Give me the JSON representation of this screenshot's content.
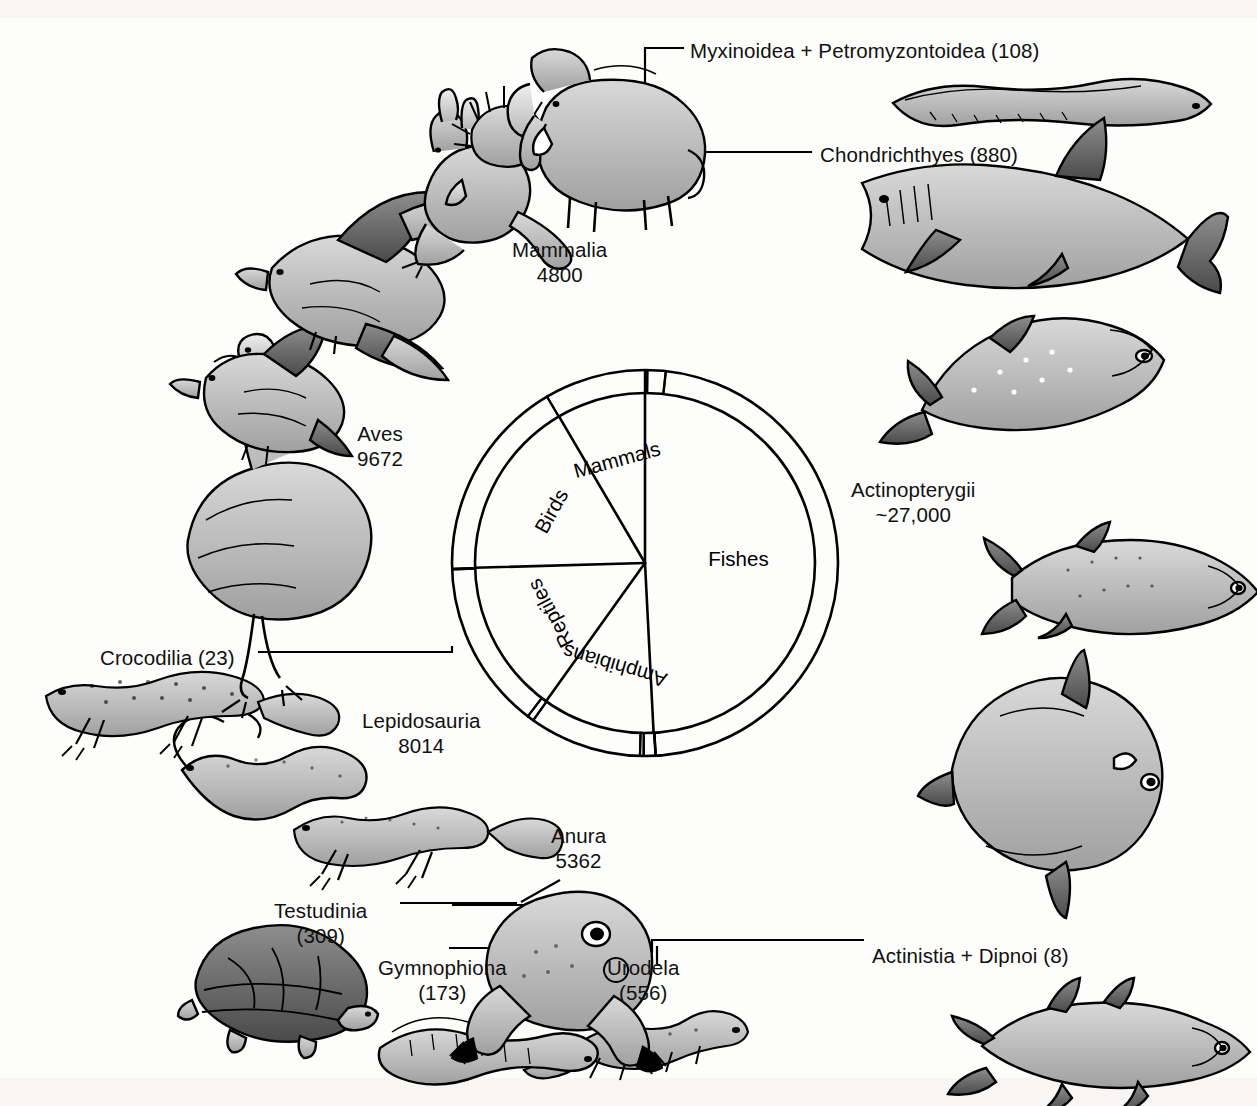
{
  "figure": {
    "type": "sunburst",
    "title": "",
    "background": "#fdfdfb",
    "stroke": "#000000",
    "center": {
      "x": 645,
      "y": 563
    },
    "inner_radius": 170,
    "outer_radius": 193
  },
  "inner_ring": {
    "label": "Vertebrate classes",
    "segments": [
      {
        "name": "Fishes",
        "label": "Fishes",
        "value": 27996,
        "start_deg": -90,
        "end_deg": 87.1,
        "rotate": 0
      },
      {
        "name": "Amphibians",
        "label": "Amphibians",
        "value": 6091,
        "start_deg": 87.1,
        "end_deg": 125.6,
        "rotate": 73
      },
      {
        "name": "Reptiles",
        "label": "Reptiles",
        "value": 8346,
        "start_deg": 125.6,
        "end_deg": 178.4,
        "rotate": 28
      },
      {
        "name": "Birds",
        "label": "Birds",
        "value": 9672,
        "start_deg": 178.4,
        "end_deg": 239.6,
        "rotate": -27
      },
      {
        "name": "Mammals",
        "label": "Mammals",
        "value": 4800,
        "start_deg": 239.6,
        "end_deg": 270,
        "rotate": -75
      }
    ]
  },
  "outer_ring": {
    "label": "Taxa with species counts",
    "segments": [
      {
        "name": "myxinoidea-petromyzontoidea",
        "taxon": "Myxinoidea + Petromyzontoidea",
        "count": "108",
        "count_display": "(108)",
        "start_deg": -90.0,
        "end_deg": -89.3
      },
      {
        "name": "chondrichthyes",
        "taxon": "Chondrichthyes",
        "count": "880",
        "count_display": "(880)",
        "start_deg": -89.3,
        "end_deg": -83.8
      },
      {
        "name": "actinopterygii",
        "taxon": "Actinopterygii",
        "count": "~27,000",
        "count_display": "~27,000",
        "start_deg": -83.8,
        "end_deg": 86.8
      },
      {
        "name": "actinistia-dipnoi",
        "taxon": "Actinistia + Dipnoi",
        "count": "8",
        "count_display": "(8)",
        "start_deg": 86.8,
        "end_deg": 86.9
      },
      {
        "name": "urodela",
        "taxon": "Urodela",
        "count": "556",
        "count_display": "(556)",
        "start_deg": 86.9,
        "end_deg": 90.4
      },
      {
        "name": "gymnophiona",
        "taxon": "Gymnophiona",
        "count": "173",
        "count_display": "(173)",
        "start_deg": 90.4,
        "end_deg": 91.5
      },
      {
        "name": "anura",
        "taxon": "Anura",
        "count": "5362",
        "count_display": "5362",
        "start_deg": 91.5,
        "end_deg": 125.4
      },
      {
        "name": "testudinia",
        "taxon": "Testudinia",
        "count": "309",
        "count_display": "(309)",
        "start_deg": 125.4,
        "end_deg": 127.4
      },
      {
        "name": "lepidosauria",
        "taxon": "Lepidosauria",
        "count": "8014",
        "count_display": "8014",
        "start_deg": 127.4,
        "end_deg": 178.1
      },
      {
        "name": "crocodilia",
        "taxon": "Crocodilia",
        "count": "23",
        "count_display": "(23)",
        "start_deg": 178.1,
        "end_deg": 178.3
      },
      {
        "name": "aves",
        "taxon": "Aves",
        "count": "9672",
        "count_display": "9672",
        "start_deg": 178.3,
        "end_deg": 239.5
      },
      {
        "name": "mammalia",
        "taxon": "Mammalia",
        "count": "4800",
        "count_display": "4800",
        "start_deg": 239.5,
        "end_deg": 270.0
      }
    ]
  },
  "callout_labels": [
    {
      "name": "label-myxinoidea",
      "line1": "Myxinoidea + Petromyzontoidea (108)",
      "line2": "",
      "x": 690,
      "y": 38,
      "align": "left"
    },
    {
      "name": "label-chondrichthyes",
      "line1": "Chondrichthyes (880)",
      "line2": "",
      "x": 820,
      "y": 142,
      "align": "left"
    },
    {
      "name": "label-actinopterygii",
      "line1": "Actinopterygii",
      "line2": "~27,000",
      "x": 851,
      "y": 477,
      "align": "left"
    },
    {
      "name": "label-actinistia",
      "line1": "Actinistia + Dipnoi (8)",
      "line2": "",
      "x": 872,
      "y": 943,
      "align": "left"
    },
    {
      "name": "label-urodela",
      "line1": "Urodela",
      "line2": "(556)",
      "x": 607,
      "y": 955,
      "align": "left"
    },
    {
      "name": "label-gymnophiona",
      "line1": "Gymnophiona",
      "line2": "(173)",
      "x": 378,
      "y": 955,
      "align": "left"
    },
    {
      "name": "label-testudinia",
      "line1": "Testudinia",
      "line2": "(309)",
      "x": 274,
      "y": 898,
      "align": "left"
    },
    {
      "name": "label-crocodilia",
      "line1": "Crocodilia (23)",
      "line2": "",
      "x": 100,
      "y": 645,
      "align": "left"
    },
    {
      "name": "label-anura",
      "line1": "Anura",
      "line2": "5362",
      "x": 551,
      "y": 823,
      "align": "left"
    },
    {
      "name": "label-lepidosauria",
      "line1": "Lepidosauria",
      "line2": "8014",
      "x": 362,
      "y": 708,
      "align": "left"
    },
    {
      "name": "label-aves",
      "line1": "Aves",
      "line2": "9672",
      "x": 357,
      "y": 421,
      "align": "left"
    },
    {
      "name": "label-mammalia",
      "line1": "Mammalia",
      "line2": "4800",
      "x": 512,
      "y": 237,
      "align": "left"
    }
  ],
  "illustrations": [
    {
      "name": "hagfish-lamprey-illustration",
      "caption": "Myxinoidea + Petromyzontoidea"
    },
    {
      "name": "shark-illustration",
      "caption": "Chondrichthyes"
    },
    {
      "name": "trout-illustration",
      "caption": "Actinopterygii"
    },
    {
      "name": "tuna-illustration",
      "caption": "Actinopterygii"
    },
    {
      "name": "sunfish-illustration",
      "caption": "Actinopterygii"
    },
    {
      "name": "coelacanth-illustration",
      "caption": "Actinistia + Dipnoi"
    },
    {
      "name": "salamander-illustration",
      "caption": "Urodela"
    },
    {
      "name": "caecilian-illustration",
      "caption": "Gymnophiona"
    },
    {
      "name": "frog-illustration",
      "caption": "Anura"
    },
    {
      "name": "turtle-illustration",
      "caption": "Testudinia"
    },
    {
      "name": "lizard-illustration",
      "caption": "Lepidosauria"
    },
    {
      "name": "snake-illustration",
      "caption": "Lepidosauria"
    },
    {
      "name": "crocodile-illustration",
      "caption": "Crocodilia"
    },
    {
      "name": "ostrich-illustration",
      "caption": "Aves"
    },
    {
      "name": "songbird-illustration",
      "caption": "Aves"
    },
    {
      "name": "hawk-illustration",
      "caption": "Aves"
    },
    {
      "name": "kangaroo-illustration",
      "caption": "Mammalia"
    },
    {
      "name": "echidna-illustration",
      "caption": "Mammalia"
    },
    {
      "name": "elephant-illustration",
      "caption": "Mammalia"
    }
  ],
  "chart_data": {
    "type": "pie",
    "legend": "none",
    "grid": false,
    "rings": [
      {
        "name": "inner",
        "categories": [
          "Fishes",
          "Amphibians",
          "Reptiles",
          "Birds",
          "Mammals"
        ],
        "values": [
          27996,
          6091,
          8346,
          9672,
          4800
        ]
      },
      {
        "name": "outer",
        "categories": [
          "Myxinoidea + Petromyzontoidea",
          "Chondrichthyes",
          "Actinopterygii",
          "Actinistia + Dipnoi",
          "Urodela",
          "Gymnophiona",
          "Anura",
          "Testudinia",
          "Lepidosauria",
          "Crocodilia",
          "Aves",
          "Mammalia"
        ],
        "values": [
          108,
          880,
          27000,
          8,
          556,
          173,
          5362,
          309,
          8014,
          23,
          9672,
          4800
        ]
      }
    ],
    "total_species": 56905,
    "xlabel": "",
    "ylabel": ""
  }
}
